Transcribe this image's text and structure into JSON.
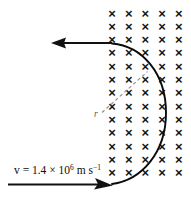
{
  "figure": {
    "background_color": "#ffffff",
    "width": 191,
    "height": 197
  },
  "field_region": {
    "symbol": "×",
    "symbol_name": "field-into-page-cross",
    "columns": 5,
    "rows": 13,
    "column_x": [
      112,
      128.7,
      145.4,
      162.1,
      178.8
    ],
    "row_y": [
      13,
      26.3,
      39.6,
      52.9,
      66.2,
      79.5,
      92.8,
      106.1,
      119.4,
      132.7,
      146,
      159.3,
      172.6
    ],
    "color": "#151515"
  },
  "velocity_label": {
    "prefix": "v = 1.4 × 10",
    "exponent": "6",
    "unit_m": " m s",
    "unit_exponent": "−1",
    "full_text": "v = 1.4 × 10⁶ m s⁻¹",
    "x": 14,
    "y": 174,
    "color": "#0d0d0d"
  },
  "radius_label": {
    "text": "r",
    "x": 95,
    "y": 114,
    "color": "#5a5a5a"
  },
  "incoming_arrow": {
    "name": "incoming-velocity-arrow",
    "direction": "right",
    "x_start": 8,
    "x_end": 112,
    "y": 184.5,
    "color": "#111111"
  },
  "outgoing_arrow": {
    "name": "outgoing-velocity-arrow",
    "direction": "left",
    "x_start": 112,
    "x_end": 52,
    "y": 43,
    "color": "#111111"
  },
  "trajectory": {
    "name": "semicircular-trajectory",
    "entry_point": [
      112,
      184.5
    ],
    "exit_point": [
      112,
      43
    ],
    "rightmost_x": 166,
    "center": [
      110,
      113.5
    ],
    "radius": 71,
    "color": "#0b0b0b"
  },
  "radius_line": {
    "name": "radius-dashed-line",
    "x1": 102,
    "y1": 112,
    "x2": 148,
    "y2": 71,
    "color": "#8d8d8d"
  }
}
